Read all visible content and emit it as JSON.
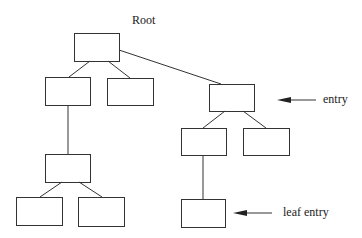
{
  "title": "Root",
  "labels": {
    "entry": "entry",
    "leaf_entry": "leaf entry"
  },
  "colors": {
    "stroke": "#333333",
    "background": "#ffffff"
  },
  "nodes": [
    {
      "id": "root",
      "x": 74,
      "y": 33,
      "w": 45,
      "h": 28
    },
    {
      "id": "l1-left",
      "x": 45,
      "y": 77,
      "w": 45,
      "h": 28
    },
    {
      "id": "l1-mid",
      "x": 107,
      "y": 78,
      "w": 46,
      "h": 27
    },
    {
      "id": "r1",
      "x": 209,
      "y": 84,
      "w": 45,
      "h": 27
    },
    {
      "id": "r2-left",
      "x": 181,
      "y": 128,
      "w": 45,
      "h": 27
    },
    {
      "id": "r2-right",
      "x": 243,
      "y": 128,
      "w": 46,
      "h": 27
    },
    {
      "id": "l2",
      "x": 45,
      "y": 154,
      "w": 45,
      "h": 28
    },
    {
      "id": "l3-left",
      "x": 16,
      "y": 197,
      "w": 46,
      "h": 28
    },
    {
      "id": "l3-right",
      "x": 78,
      "y": 197,
      "w": 46,
      "h": 29
    },
    {
      "id": "r3",
      "x": 181,
      "y": 199,
      "w": 44,
      "h": 28
    }
  ]
}
